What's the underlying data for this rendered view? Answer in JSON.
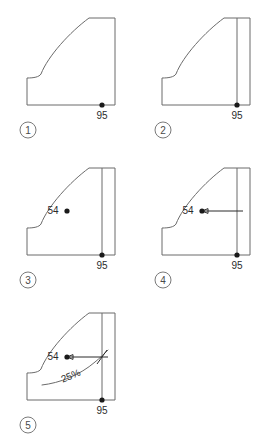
{
  "figure": {
    "background_color": "#ffffff",
    "outline_color": "#6b6b6b",
    "annotation_color": "#2b2b2b",
    "dot_color": "#1a1a1a",
    "step_count": 5,
    "panels": [
      {
        "id": "panel-1",
        "step_label": "1",
        "dimension_labels": [
          "95"
        ],
        "has_vertical_construction_line": false,
        "has_upper_point": false,
        "has_arrow": false,
        "has_percent_curve": false
      },
      {
        "id": "panel-2",
        "step_label": "2",
        "dimension_labels": [
          "95"
        ],
        "has_vertical_construction_line": true,
        "has_upper_point": false,
        "has_arrow": false,
        "has_percent_curve": false
      },
      {
        "id": "panel-3",
        "step_label": "3",
        "dimension_labels": [
          "54",
          "95"
        ],
        "has_vertical_construction_line": true,
        "has_upper_point": true,
        "has_arrow": false,
        "has_percent_curve": false
      },
      {
        "id": "panel-4",
        "step_label": "4",
        "dimension_labels": [
          "54",
          "95"
        ],
        "has_vertical_construction_line": true,
        "has_upper_point": true,
        "has_arrow": true,
        "has_percent_curve": false
      },
      {
        "id": "panel-5",
        "step_label": "5",
        "dimension_labels": [
          "54",
          "95",
          "25%"
        ],
        "has_vertical_construction_line": true,
        "has_upper_point": true,
        "has_arrow": true,
        "has_percent_curve": true
      }
    ],
    "labels": {
      "lower_point_value": "95",
      "upper_point_value": "54",
      "percent_value": "25%",
      "step_1": "1",
      "step_2": "2",
      "step_3": "3",
      "step_4": "4",
      "step_5": "5"
    }
  }
}
